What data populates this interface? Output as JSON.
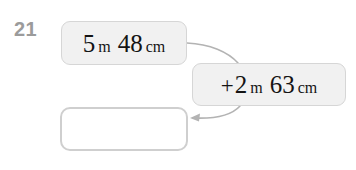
{
  "page": {
    "background_color": "#ffffff",
    "question_number": "21"
  },
  "colors": {
    "box_fill": "#f1f1f1",
    "box_border": "#d6d6d6",
    "answer_fill": "#ffffff",
    "answer_border": "#cfcfcf",
    "text": "#141414",
    "number_label": "#9b9b9b",
    "arrow": "#b3b3b3"
  },
  "boxes": {
    "first": {
      "name": "first-measurement-box",
      "value_meters": "5",
      "unit_meters": "m",
      "value_centimeters": "48",
      "unit_centimeters": "cm",
      "full_text": "5 m 48 cm"
    },
    "second": {
      "name": "second-measurement-box",
      "operator": "+",
      "value_meters": "2",
      "unit_meters": "m",
      "value_centimeters": "63",
      "unit_centimeters": "cm",
      "full_text": "+2 m 63 cm"
    },
    "answer": {
      "name": "answer-box",
      "value": "",
      "placeholder": ""
    }
  },
  "arrows": [
    {
      "name": "arrow-first-to-second",
      "from": "first-measurement-box",
      "to": "second-measurement-box",
      "has_head": false
    },
    {
      "name": "arrow-second-to-answer",
      "from": "second-measurement-box",
      "to": "answer-box",
      "has_head": true
    }
  ]
}
